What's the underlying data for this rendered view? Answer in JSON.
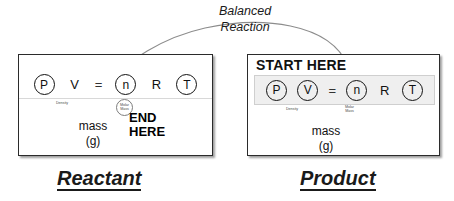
{
  "diagram": {
    "connector_label": "Balanced\nReaction",
    "connector_label_line1": "Balanced",
    "connector_label_line2": "Reaction"
  },
  "colors": {
    "ink": "#111111",
    "panel_border": "#2b2b2b",
    "row_fill": "#efefef",
    "row_border": "#cfcfcf",
    "tiny_text": "#4a4a4a",
    "divider": "#d8d8d8",
    "ellipse_stroke": "#9a9a9a",
    "background": "#ffffff"
  },
  "reactant": {
    "caption": "Reactant",
    "equation": [
      {
        "symbol": "P",
        "circled": true
      },
      {
        "symbol": "V",
        "circled": false
      },
      {
        "symbol": "=",
        "circled": false
      },
      {
        "symbol": "n",
        "circled": true
      },
      {
        "symbol": "R",
        "circled": false
      },
      {
        "symbol": "T",
        "circled": true
      }
    ],
    "density_label": "Density",
    "molar_mass_label_line1": "Molar",
    "molar_mass_label_line2": "Mass",
    "mass_line1": "mass",
    "mass_line2": "(g)",
    "marker_line1": "END",
    "marker_line2": "HERE"
  },
  "product": {
    "caption": "Product",
    "start_label": "START HERE",
    "equation": [
      {
        "symbol": "P",
        "circled": true
      },
      {
        "symbol": "V",
        "circled": true
      },
      {
        "symbol": "=",
        "circled": false
      },
      {
        "symbol": "n",
        "circled": true
      },
      {
        "symbol": "R",
        "circled": false
      },
      {
        "symbol": "T",
        "circled": true
      }
    ],
    "density_label": "Density",
    "molar_mass_label_line1": "Molar",
    "molar_mass_label_line2": "Mass",
    "mass_line1": "mass",
    "mass_line2": "(g)"
  }
}
